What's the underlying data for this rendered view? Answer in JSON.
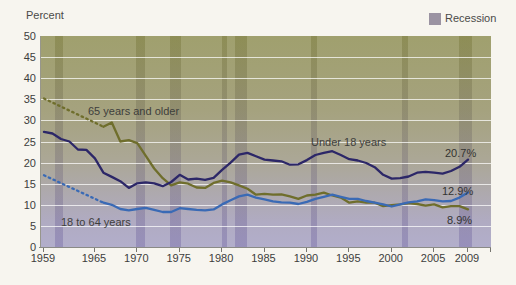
{
  "figure": {
    "axis_unit_label": "Percent",
    "legend": {
      "recession_label": "Recession",
      "recession_swatch_color": "#9b93a2"
    }
  },
  "chart_data": {
    "type": "line",
    "ylabel": "Percent",
    "ylim": [
      0,
      50
    ],
    "xlim": [
      1959,
      2012
    ],
    "yticks": [
      0,
      5,
      10,
      15,
      20,
      25,
      30,
      35,
      40,
      45,
      50
    ],
    "xticks": [
      1959,
      1965,
      1970,
      1975,
      1980,
      1985,
      1990,
      1995,
      2000,
      2005,
      2009
    ],
    "grid": "horizontal-white-lines",
    "legend_position": "top-right",
    "background_gradient": [
      "#a0a06e",
      "#b2aecb"
    ],
    "recessions": [
      [
        1960.3,
        1961.2
      ],
      [
        1969.9,
        1970.9
      ],
      [
        1973.9,
        1975.2
      ],
      [
        1980.0,
        1980.6
      ],
      [
        1981.5,
        1982.9
      ],
      [
        1990.5,
        1991.2
      ],
      [
        2001.2,
        2001.9
      ],
      [
        2007.9,
        2009.5
      ]
    ],
    "series": [
      {
        "name": "Under 18 years",
        "color": "#2c2768",
        "end_label": "20.7%",
        "solid": {
          "start_year": 1959,
          "values": [
            27.3,
            26.9,
            25.6,
            25.0,
            23.1,
            23.0,
            21.0,
            17.6,
            16.6,
            15.6,
            14.0,
            15.1,
            15.3,
            15.1,
            14.4,
            15.4,
            17.1,
            16.0,
            16.2,
            15.9,
            16.4,
            18.3,
            20.0,
            21.9,
            22.3,
            21.5,
            20.7,
            20.5,
            20.3,
            19.5,
            19.6,
            20.6,
            21.8,
            22.3,
            22.7,
            21.8,
            20.8,
            20.5,
            19.9,
            18.9,
            17.1,
            16.2,
            16.3,
            16.7,
            17.6,
            17.8,
            17.6,
            17.4,
            18.0,
            19.0,
            20.7
          ]
        }
      },
      {
        "name": "18 to 64 years",
        "color": "#3a6ab5",
        "end_label": "12.9%",
        "dashed": {
          "x": [
            1959,
            1966
          ],
          "y": [
            17.0,
            10.5
          ]
        },
        "solid": {
          "start_year": 1966,
          "values": [
            10.5,
            10.0,
            9.0,
            8.7,
            9.0,
            9.3,
            8.8,
            8.3,
            8.3,
            9.2,
            9.0,
            8.8,
            8.7,
            8.9,
            10.1,
            11.1,
            12.0,
            12.4,
            11.7,
            11.3,
            10.8,
            10.6,
            10.5,
            10.2,
            10.7,
            11.4,
            11.9,
            12.4,
            11.9,
            11.4,
            11.4,
            10.9,
            10.5,
            10.1,
            9.6,
            10.1,
            10.6,
            10.8,
            11.3,
            11.1,
            10.8,
            10.9,
            11.7,
            12.9
          ]
        }
      },
      {
        "name": "65 years and older",
        "color": "#6f6e2c",
        "end_label": "8.9%",
        "dashed": {
          "x": [
            1959,
            1966
          ],
          "y": [
            35.2,
            28.5
          ]
        },
        "solid": {
          "start_year": 1966,
          "values": [
            28.5,
            29.5,
            25.0,
            25.3,
            24.6,
            21.6,
            18.6,
            16.3,
            14.6,
            15.3,
            15.0,
            14.1,
            14.0,
            15.2,
            15.7,
            15.3,
            14.6,
            13.8,
            12.4,
            12.6,
            12.4,
            12.5,
            12.0,
            11.4,
            12.2,
            12.4,
            12.9,
            12.2,
            11.7,
            10.5,
            10.8,
            10.5,
            10.5,
            9.7,
            9.9,
            10.1,
            10.4,
            10.2,
            9.8,
            10.1,
            9.4,
            9.7,
            9.7,
            8.9
          ]
        }
      }
    ]
  }
}
